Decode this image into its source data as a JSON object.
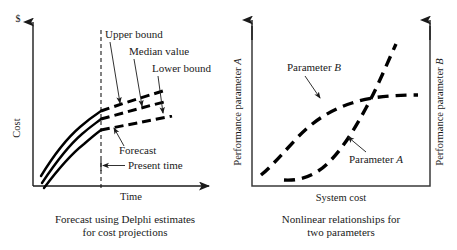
{
  "figure": {
    "left_panel": {
      "y_axis_unit": "$",
      "y_axis_label": "Cost",
      "x_axis_label": "Time",
      "annotations": {
        "upper_bound": "Upper bound",
        "median_value": "Median value",
        "lower_bound": "Lower bound",
        "forecast": "Forecast",
        "present_time": "Present time"
      },
      "caption_line1": "Forecast using Delphi estimates",
      "caption_line2": "for cost projections"
    },
    "right_panel": {
      "y_axis_left_label": "Performance parameter A",
      "y_axis_right_label": "Performance parameter B",
      "x_axis_label": "System cost",
      "annotations": {
        "parameter_b": "Parameter B",
        "parameter_a": "Parameter A"
      },
      "caption_line1": "Nonlinear relationships for",
      "caption_line2": "two parameters"
    },
    "colors": {
      "ink": "#1a1a1a",
      "curve": "#000000",
      "box": "#3a3a3a",
      "background": "#ffffff"
    }
  },
  "chart_data": [
    {
      "type": "line",
      "panel": "left",
      "title": "Forecast using Delphi estimates for cost projections",
      "xlabel": "Time",
      "ylabel": "Cost",
      "y_unit": "$",
      "xlim": [
        0,
        100
      ],
      "ylim": [
        0,
        100
      ],
      "grid": false,
      "legend": "none",
      "annotations": [
        {
          "text": "Upper bound",
          "points_to": "upper dashed forecast band"
        },
        {
          "text": "Median value",
          "points_to": "middle dashed forecast band"
        },
        {
          "text": "Lower bound",
          "points_to": "lower dashed forecast band"
        },
        {
          "text": "Forecast",
          "points_to": "dashed region right of present time"
        },
        {
          "text": "Present time",
          "points_to": "vertical dashed line"
        }
      ],
      "present_time_x": 38,
      "series": [
        {
          "name": "Upper bound",
          "style": "solid then dashed after present time",
          "x": [
            3,
            10,
            20,
            30,
            38,
            50,
            62,
            75,
            88,
            100
          ],
          "y": [
            22,
            38,
            52,
            61,
            66,
            73,
            79,
            85,
            90,
            95
          ]
        },
        {
          "name": "Median value",
          "style": "solid then dashed after present time",
          "x": [
            3,
            10,
            20,
            30,
            38,
            50,
            62,
            75,
            88,
            100
          ],
          "y": [
            13,
            28,
            42,
            51,
            56,
            62,
            68,
            74,
            79,
            84
          ]
        },
        {
          "name": "Lower bound",
          "style": "solid then dashed after present time",
          "x": [
            3,
            10,
            20,
            30,
            38,
            50,
            62,
            75,
            88,
            100
          ],
          "y": [
            6,
            19,
            33,
            42,
            46,
            52,
            57,
            62,
            67,
            72
          ]
        }
      ]
    },
    {
      "type": "line",
      "panel": "right",
      "title": "Nonlinear relationships for two parameters",
      "xlabel": "System cost",
      "ylabel": "Performance parameter A",
      "y2label": "Performance parameter B",
      "xlim": [
        0,
        100
      ],
      "ylim": [
        0,
        100
      ],
      "grid": false,
      "legend": "inline labels",
      "annotations": [
        {
          "text": "Parameter B",
          "points_to": "S-shaped saturating curve"
        },
        {
          "text": "Parameter A",
          "points_to": "J-shaped accelerating curve"
        }
      ],
      "series": [
        {
          "name": "Parameter B",
          "style": "dashed",
          "shape": "S-curve / saturating",
          "x": [
            4,
            14,
            26,
            38,
            50,
            62,
            74,
            86,
            96
          ],
          "y": [
            8,
            22,
            42,
            56,
            66,
            73,
            77,
            79,
            79
          ]
        },
        {
          "name": "Parameter A",
          "style": "dashed",
          "shape": "J-curve / accelerating",
          "x": [
            18,
            28,
            38,
            48,
            58,
            68,
            76,
            84,
            90
          ],
          "y": [
            7,
            8,
            14,
            24,
            38,
            56,
            70,
            84,
            95
          ]
        }
      ]
    }
  ]
}
